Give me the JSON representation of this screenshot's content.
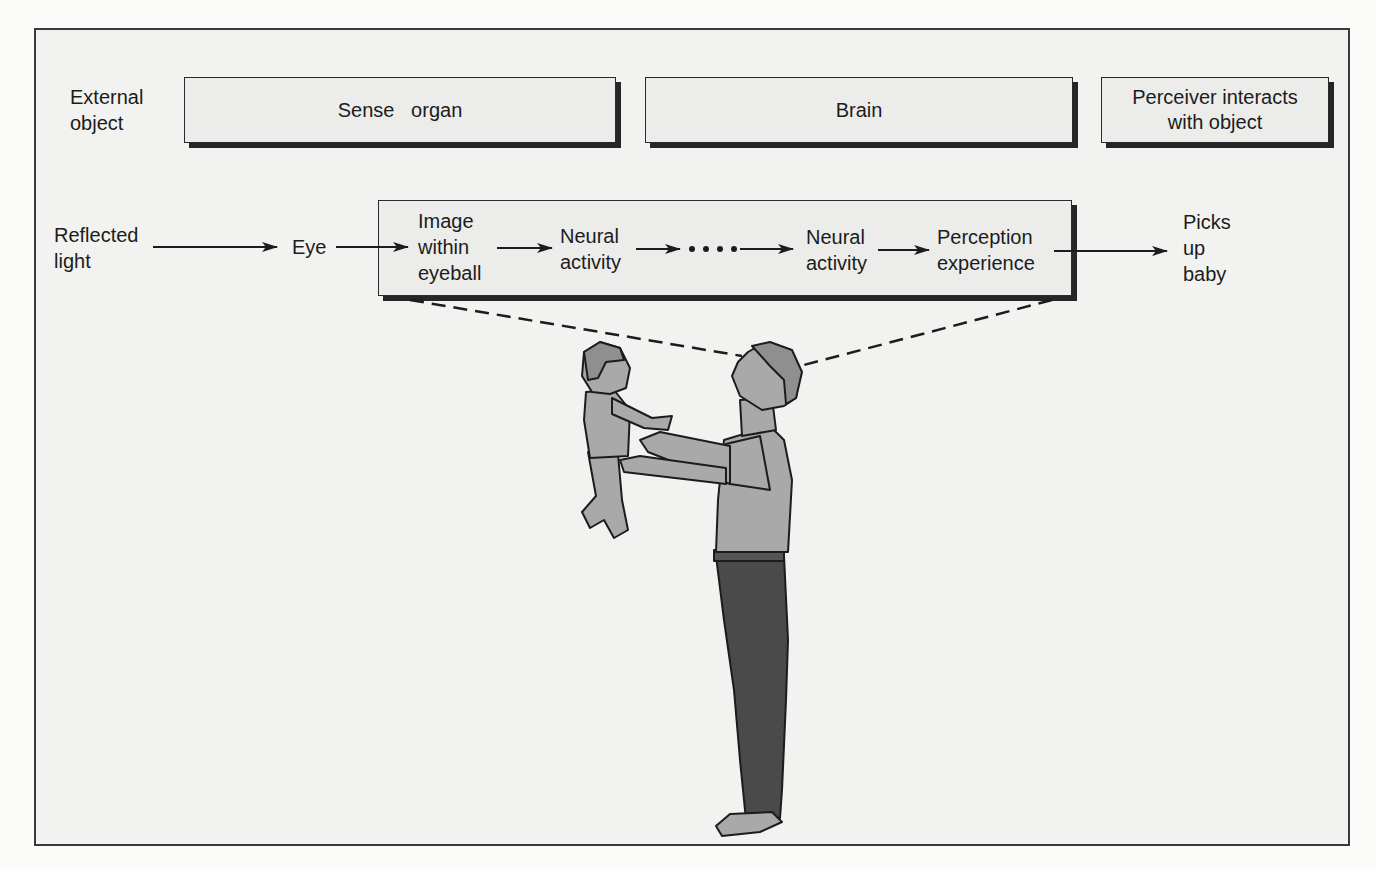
{
  "header_row": {
    "external_object": "External\nobject",
    "sense_organ": "Sense   organ",
    "brain": "Brain",
    "perceiver_interacts": "Perceiver interacts\nwith object"
  },
  "flow_row": {
    "reflected_light": "Reflected\nlight",
    "eye": "Eye",
    "image_within_eyeball": "Image\nwithin\neyeball",
    "neural_activity_1": "Neural\nactivity",
    "ellipsis": "• • • •",
    "neural_activity_2": "Neural\nactivity",
    "perception_experience": "Perception\nexperience",
    "picks_up_baby": "Picks\nup\nbaby"
  },
  "illustration": {
    "description": "Man holding up a baby, dashed lines from the man's eye to the internal process box",
    "figures": [
      "man-icon",
      "baby-icon"
    ]
  },
  "colors": {
    "background": "#f2f2f0",
    "box_fill": "#ececea",
    "line": "#1c1c1c",
    "skin_clothing": "#a9a9a9",
    "pants": "#4a4a4a"
  }
}
